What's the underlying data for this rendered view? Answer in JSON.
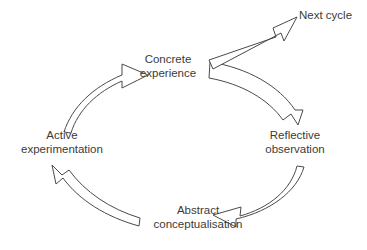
{
  "diagram": {
    "background_color": "#ffffff",
    "stroke_color": "#4a4a4a",
    "text_color": "#3b3b3b",
    "nodes": [
      {
        "id": "concrete-experience",
        "line1": "Concrete",
        "line2": "experience"
      },
      {
        "id": "reflective-observation",
        "line1": "Reflective",
        "line2": "observation"
      },
      {
        "id": "abstract-conceptualisation",
        "line1": "Abstract",
        "line2": "conceptualisation"
      },
      {
        "id": "active-experimentation",
        "line1": "Active",
        "line2": "experimentation"
      },
      {
        "id": "next-cycle",
        "line1": "Next cycle",
        "line2": ""
      }
    ],
    "arrows": [
      {
        "id": "arrow-concrete-to-reflective",
        "from": "Concrete experience",
        "to": "Reflective observation",
        "style": "curved-block-arrow",
        "direction": "clockwise"
      },
      {
        "id": "arrow-reflective-to-abstract",
        "from": "Reflective observation",
        "to": "Abstract conceptualisation",
        "style": "curved-block-arrow",
        "direction": "clockwise"
      },
      {
        "id": "arrow-abstract-to-active",
        "from": "Abstract conceptualisation",
        "to": "Active experimentation",
        "style": "curved-block-arrow",
        "direction": "clockwise"
      },
      {
        "id": "arrow-active-to-concrete",
        "from": "Active experimentation",
        "to": "Concrete experience",
        "style": "curved-block-arrow",
        "direction": "clockwise"
      },
      {
        "id": "arrow-concrete-to-next-cycle",
        "from": "Concrete experience",
        "to": "Next cycle",
        "style": "straight-block-arrow",
        "direction": "up-right"
      }
    ]
  }
}
